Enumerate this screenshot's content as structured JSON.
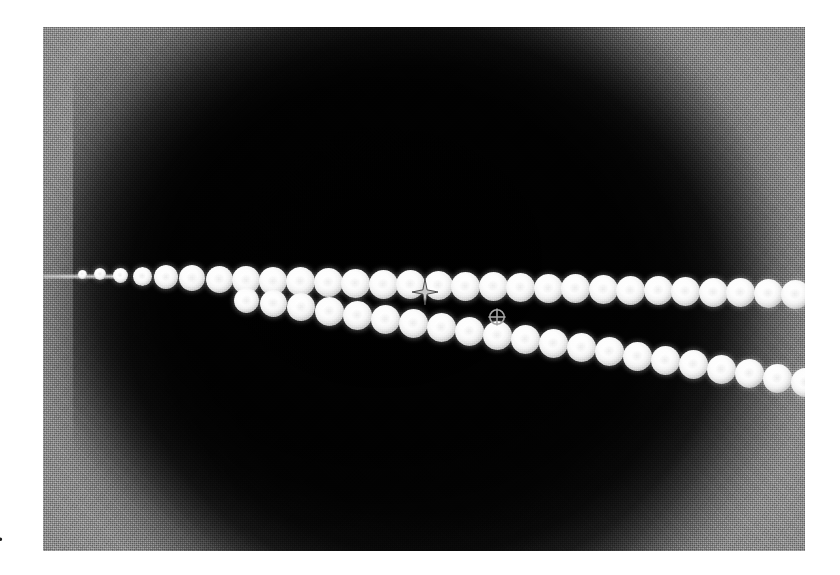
{
  "panel": {
    "name": "grayscale-micrograph",
    "x": 43,
    "y": 27,
    "width": 762,
    "height": 524,
    "background_color": "#8b8b8b",
    "vignette_color": "#050505",
    "bead_color": "#ffffff"
  },
  "margin": {
    "label_number": "0",
    "label_dot": "."
  },
  "markers": {
    "cursor": {
      "icon": "four-point-star-cursor",
      "x": 425,
      "y": 292,
      "color": "#b9b9b9"
    },
    "target": {
      "icon": "crosshair-circle-icon",
      "glyph": "⊕",
      "x": 497,
      "y": 317,
      "color": "#9a9a9a"
    }
  },
  "chain_upper": {
    "label": "upper-bead-chain",
    "bead_count": 28,
    "beads": [
      {
        "x": 82,
        "y": 274,
        "d": 9
      },
      {
        "x": 100,
        "y": 274,
        "d": 12
      },
      {
        "x": 120,
        "y": 275,
        "d": 15
      },
      {
        "x": 142,
        "y": 276,
        "d": 19
      },
      {
        "x": 166,
        "y": 277,
        "d": 24
      },
      {
        "x": 192,
        "y": 278,
        "d": 26
      },
      {
        "x": 219,
        "y": 279,
        "d": 27
      },
      {
        "x": 246,
        "y": 280,
        "d": 28
      },
      {
        "x": 273,
        "y": 281,
        "d": 28
      },
      {
        "x": 300,
        "y": 281,
        "d": 29
      },
      {
        "x": 328,
        "y": 282,
        "d": 29
      },
      {
        "x": 355,
        "y": 283,
        "d": 29
      },
      {
        "x": 383,
        "y": 284,
        "d": 29
      },
      {
        "x": 410,
        "y": 284,
        "d": 29
      },
      {
        "x": 438,
        "y": 285,
        "d": 29
      },
      {
        "x": 465,
        "y": 286,
        "d": 29
      },
      {
        "x": 493,
        "y": 286,
        "d": 29
      },
      {
        "x": 520,
        "y": 287,
        "d": 29
      },
      {
        "x": 548,
        "y": 288,
        "d": 29
      },
      {
        "x": 575,
        "y": 288,
        "d": 29
      },
      {
        "x": 603,
        "y": 289,
        "d": 29
      },
      {
        "x": 630,
        "y": 290,
        "d": 29
      },
      {
        "x": 658,
        "y": 290,
        "d": 29
      },
      {
        "x": 685,
        "y": 291,
        "d": 29
      },
      {
        "x": 713,
        "y": 292,
        "d": 29
      },
      {
        "x": 740,
        "y": 292,
        "d": 29
      },
      {
        "x": 768,
        "y": 293,
        "d": 29
      },
      {
        "x": 795,
        "y": 294,
        "d": 29
      }
    ]
  },
  "chain_lower": {
    "label": "lower-bead-chain",
    "bead_count": 22,
    "beads": [
      {
        "x": 246,
        "y": 300,
        "d": 25
      },
      {
        "x": 273,
        "y": 303,
        "d": 27
      },
      {
        "x": 301,
        "y": 307,
        "d": 28
      },
      {
        "x": 329,
        "y": 311,
        "d": 29
      },
      {
        "x": 357,
        "y": 315,
        "d": 29
      },
      {
        "x": 385,
        "y": 319,
        "d": 29
      },
      {
        "x": 413,
        "y": 323,
        "d": 29
      },
      {
        "x": 441,
        "y": 327,
        "d": 29
      },
      {
        "x": 469,
        "y": 331,
        "d": 29
      },
      {
        "x": 497,
        "y": 335,
        "d": 29
      },
      {
        "x": 525,
        "y": 339,
        "d": 29
      },
      {
        "x": 553,
        "y": 343,
        "d": 29
      },
      {
        "x": 581,
        "y": 347,
        "d": 29
      },
      {
        "x": 609,
        "y": 351,
        "d": 29
      },
      {
        "x": 637,
        "y": 356,
        "d": 29
      },
      {
        "x": 665,
        "y": 360,
        "d": 29
      },
      {
        "x": 693,
        "y": 364,
        "d": 29
      },
      {
        "x": 721,
        "y": 369,
        "d": 29
      },
      {
        "x": 749,
        "y": 373,
        "d": 29
      },
      {
        "x": 777,
        "y": 378,
        "d": 29
      },
      {
        "x": 805,
        "y": 382,
        "d": 29
      },
      {
        "x": 833,
        "y": 387,
        "d": 29
      }
    ]
  }
}
